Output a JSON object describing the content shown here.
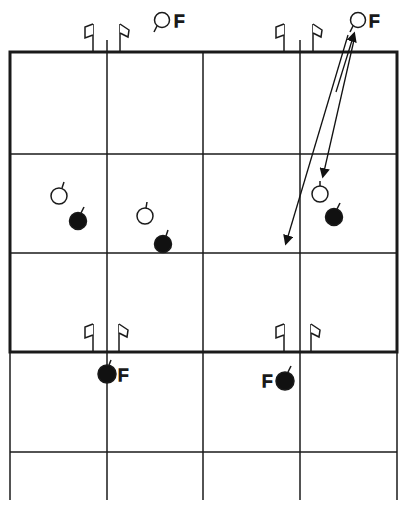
{
  "diagram": {
    "type": "formation-grid",
    "colors": {
      "line": "#1a1a1a",
      "filled": "#111111",
      "open": "#ffffff"
    },
    "labels": {
      "top_left_open": "F",
      "top_right_open": "F",
      "bottom_left_filled": "F",
      "bottom_right_filled": "F"
    },
    "players": [
      {
        "id": "open-top-mid",
        "kind": "open",
        "label": "F"
      },
      {
        "id": "open-top-right",
        "kind": "open",
        "label": "F"
      },
      {
        "id": "open-left",
        "kind": "open"
      },
      {
        "id": "filled-left",
        "kind": "filled"
      },
      {
        "id": "open-center-left",
        "kind": "open"
      },
      {
        "id": "filled-center-left",
        "kind": "filled"
      },
      {
        "id": "open-right",
        "kind": "open"
      },
      {
        "id": "filled-right",
        "kind": "filled"
      },
      {
        "id": "filled-bottom-left",
        "kind": "filled",
        "label": "F"
      },
      {
        "id": "filled-bottom-right",
        "kind": "filled",
        "label": "F"
      }
    ],
    "flags": 8,
    "arrows": 2
  }
}
